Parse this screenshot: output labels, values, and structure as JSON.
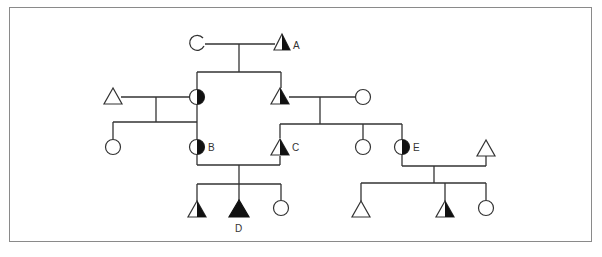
{
  "caption": "",
  "colors": {
    "line": "#333333",
    "fill": "#111111",
    "frame": "#8a8a8a",
    "background": "#ffffff"
  },
  "legend_semantics": {
    "triangle": "male",
    "circle": "female",
    "half-filled": "carrier / partially affected",
    "filled": "affected"
  },
  "individuals": [
    {
      "id": "I-1",
      "shape": "circle",
      "fill": "open",
      "x": 197,
      "y": 43,
      "label": ""
    },
    {
      "id": "I-2",
      "shape": "triangle",
      "fill": "half",
      "x": 282,
      "y": 43,
      "label": "A"
    },
    {
      "id": "II-1",
      "shape": "triangle",
      "fill": "none",
      "x": 113,
      "y": 96,
      "label": ""
    },
    {
      "id": "II-2",
      "shape": "circle",
      "fill": "half",
      "x": 197,
      "y": 97,
      "label": ""
    },
    {
      "id": "II-3",
      "shape": "triangle",
      "fill": "half",
      "x": 280,
      "y": 97,
      "label": ""
    },
    {
      "id": "II-4",
      "shape": "circle",
      "fill": "none",
      "x": 363,
      "y": 97,
      "label": ""
    },
    {
      "id": "III-1",
      "shape": "circle",
      "fill": "none",
      "x": 113,
      "y": 147,
      "label": ""
    },
    {
      "id": "III-2",
      "shape": "circle",
      "fill": "half",
      "x": 197,
      "y": 147,
      "label": "B"
    },
    {
      "id": "III-3",
      "shape": "triangle",
      "fill": "half",
      "x": 280,
      "y": 147,
      "label": "C"
    },
    {
      "id": "III-4",
      "shape": "circle",
      "fill": "none",
      "x": 363,
      "y": 147,
      "label": ""
    },
    {
      "id": "III-5",
      "shape": "circle",
      "fill": "half",
      "x": 402,
      "y": 147,
      "label": "E"
    },
    {
      "id": "III-6",
      "shape": "triangle",
      "fill": "none",
      "x": 486,
      "y": 148,
      "label": ""
    },
    {
      "id": "IV-1",
      "shape": "triangle",
      "fill": "half",
      "x": 197,
      "y": 210,
      "label": ""
    },
    {
      "id": "IV-2",
      "shape": "triangle",
      "fill": "full",
      "x": 239,
      "y": 210,
      "label": "D"
    },
    {
      "id": "IV-3",
      "shape": "circle",
      "fill": "none",
      "x": 281,
      "y": 208,
      "label": ""
    },
    {
      "id": "IV-4",
      "shape": "triangle",
      "fill": "none",
      "x": 361,
      "y": 210,
      "label": ""
    },
    {
      "id": "IV-5",
      "shape": "triangle",
      "fill": "half",
      "x": 445,
      "y": 210,
      "label": ""
    },
    {
      "id": "IV-6",
      "shape": "circle",
      "fill": "none",
      "x": 486,
      "y": 208,
      "label": ""
    }
  ],
  "labels": {
    "A": "A",
    "B": "B",
    "C": "C",
    "D": "D",
    "E": "E"
  }
}
